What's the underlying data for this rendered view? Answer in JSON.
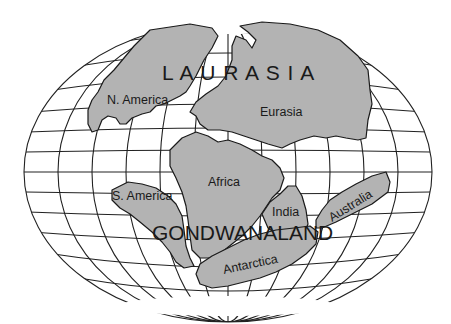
{
  "map": {
    "supercontinents": {
      "north": "L A U R A S I A",
      "south": "GONDWANALAND"
    },
    "continents": {
      "north_america": "N. America",
      "eurasia": "Eurasia",
      "south_america": "S. America",
      "africa": "Africa",
      "india": "India",
      "antarctica": "Antarctica",
      "australia": "Australia"
    },
    "colors": {
      "land": "#b3b3b3",
      "grid": "#222222",
      "background": "#ffffff"
    }
  }
}
